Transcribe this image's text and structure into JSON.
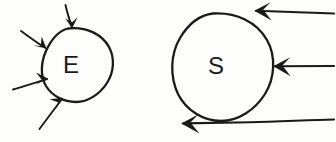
{
  "diagram": {
    "style": "hand-drawn pen sketch",
    "background_color": "#fdfdfc",
    "ink_color": "#1a1a1a",
    "nodes": [
      {
        "id": "environment",
        "label": "E",
        "shape": "circle",
        "center_x": 77,
        "center_y": 65,
        "radius_x": 35,
        "radius_y": 37,
        "incoming_arrow_count": 4,
        "outgoing_arrow_count": 0
      },
      {
        "id": "system",
        "label": "S",
        "shape": "circle",
        "center_x": 222,
        "center_y": 67,
        "radius_x": 50,
        "radius_y": 54,
        "incoming_arrow_count": 2,
        "outgoing_arrow_count": 1
      }
    ],
    "arrows": [
      {
        "id": "e-arrow-top",
        "target": "environment",
        "direction": "down",
        "from_x": 65,
        "from_y": 5,
        "to_x": 72,
        "to_y": 28
      },
      {
        "id": "e-arrow-upper-left",
        "target": "environment",
        "direction": "down-right",
        "from_x": 21,
        "from_y": 31,
        "to_x": 46,
        "to_y": 48
      },
      {
        "id": "e-arrow-left",
        "target": "environment",
        "direction": "right",
        "from_x": 13,
        "from_y": 89,
        "to_x": 48,
        "to_y": 79
      },
      {
        "id": "e-arrow-bottom-left",
        "target": "environment",
        "direction": "up-right",
        "from_x": 40,
        "from_y": 129,
        "to_x": 63,
        "to_y": 98
      },
      {
        "id": "s-arrow-top-right",
        "target": "system",
        "direction": "left",
        "from_x": 334,
        "from_y": 13,
        "to_x": 255,
        "to_y": 11
      },
      {
        "id": "s-arrow-middle-right",
        "target": "system",
        "direction": "left",
        "from_x": 334,
        "from_y": 66,
        "to_x": 274,
        "to_y": 66
      },
      {
        "id": "s-arrow-bottom-out",
        "source": "system",
        "direction": "left",
        "from_x": 300,
        "from_y": 120,
        "to_x": 182,
        "to_y": 123
      }
    ]
  }
}
